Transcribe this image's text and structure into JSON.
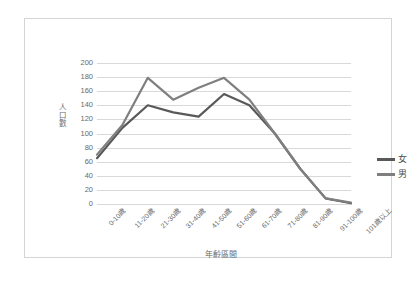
{
  "chart_data": {
    "type": "line",
    "title": "",
    "xlabel": "年齡區間",
    "ylabel": "人口數",
    "categories": [
      "0-10歲",
      "11-20歲",
      "21-30歲",
      "31-40歲",
      "41-50歲",
      "51-60歲",
      "61-70歲",
      "71-80歲",
      "81-90歲",
      "91-100歲",
      "101歲以上"
    ],
    "series": [
      {
        "name": "女",
        "color": "#595959",
        "values": [
          65,
          108,
          140,
          130,
          124,
          156,
          140,
          100,
          50,
          8,
          1
        ]
      },
      {
        "name": "男",
        "color": "#7f7f7f",
        "values": [
          70,
          112,
          179,
          148,
          165,
          179,
          148,
          100,
          50,
          8,
          2
        ]
      }
    ],
    "ylim": [
      0,
      200
    ],
    "yticks": [
      0,
      20,
      40,
      60,
      80,
      100,
      120,
      140,
      160,
      180,
      200
    ],
    "ytick_labels": [
      "0",
      "20",
      "40",
      "60",
      "80",
      "100",
      "120",
      "140",
      "160",
      "180",
      "200"
    ],
    "grid": true,
    "grid_axis": "y",
    "legend_position": "right",
    "frame_color": "#d4d4d4",
    "grid_color": "#d9d9d9",
    "text_color": "#6a6a6a"
  }
}
